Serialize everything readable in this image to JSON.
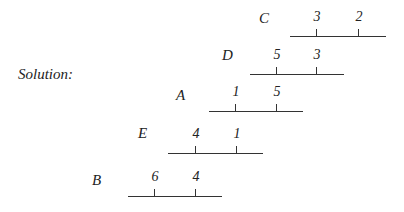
{
  "solution_label": "Solution:",
  "rows": [
    {
      "label": "C",
      "label_x": 259,
      "label_y": 10,
      "line_x1": 290,
      "line_x2": 386,
      "line_y": 36,
      "ticks": [
        {
          "x": 316,
          "value": "3"
        },
        {
          "x": 358,
          "value": "2"
        }
      ]
    },
    {
      "label": "D",
      "label_x": 222,
      "label_y": 47,
      "line_x1": 250,
      "line_x2": 344,
      "line_y": 74,
      "ticks": [
        {
          "x": 276,
          "value": "5"
        },
        {
          "x": 316,
          "value": "3"
        }
      ]
    },
    {
      "label": "A",
      "label_x": 176,
      "label_y": 87,
      "line_x1": 209,
      "line_x2": 303,
      "line_y": 111,
      "ticks": [
        {
          "x": 235,
          "value": "1"
        },
        {
          "x": 276,
          "value": "5"
        }
      ]
    },
    {
      "label": "E",
      "label_x": 138,
      "label_y": 125,
      "line_x1": 168,
      "line_x2": 263,
      "line_y": 153,
      "ticks": [
        {
          "x": 195,
          "value": "4"
        },
        {
          "x": 236,
          "value": "1"
        }
      ]
    },
    {
      "label": "B",
      "label_x": 92,
      "label_y": 172,
      "line_x1": 128,
      "line_x2": 222,
      "line_y": 196,
      "ticks": [
        {
          "x": 154,
          "value": "6"
        },
        {
          "x": 195,
          "value": "4"
        }
      ]
    }
  ]
}
